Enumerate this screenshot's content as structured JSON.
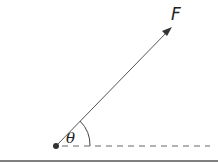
{
  "diagram": {
    "force_label": "F",
    "angle_label": "θ",
    "colors": {
      "stroke": "#444444",
      "dot": "#333333",
      "baseline": "#555555"
    }
  }
}
